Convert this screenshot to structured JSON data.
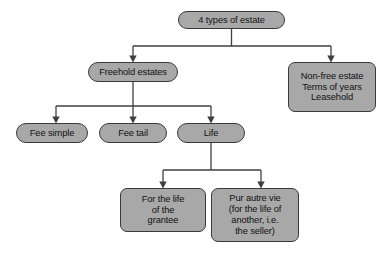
{
  "diagram": {
    "title_text": "4 types of estate",
    "background_color": "#ffffff",
    "node_fill_color": "#a8a8a8",
    "node_border_color": "#3a3a3a",
    "connector_color": "#3f3f3f",
    "text_color": "#111111",
    "nodes": {
      "root": {
        "label": "4 types of estate",
        "lines": [
          "4 types of estate"
        ]
      },
      "freehold": {
        "label": "Freehold estates",
        "lines": [
          "Freehold estates"
        ]
      },
      "nonfree": {
        "label": "Non-free estate Terms of years Leasehold",
        "lines": [
          "Non-free estate",
          "Terms of years",
          "Leasehold"
        ]
      },
      "fee_simple": {
        "label": "Fee simple",
        "lines": [
          "Fee simple"
        ]
      },
      "fee_tail": {
        "label": "Fee tail",
        "lines": [
          "Fee tail"
        ]
      },
      "life": {
        "label": "Life",
        "lines": [
          "Life"
        ]
      },
      "for_life_grantee": {
        "label": "For the life of the grantee",
        "lines": [
          "For the life",
          "of the",
          "grantee"
        ]
      },
      "pur_autre_vie": {
        "label": "Pur autre vie (for the life of another, i.e. the seller)",
        "lines": [
          "Pur autre vie",
          "(for the life of",
          "another, i.e.",
          "the seller)"
        ]
      }
    }
  }
}
